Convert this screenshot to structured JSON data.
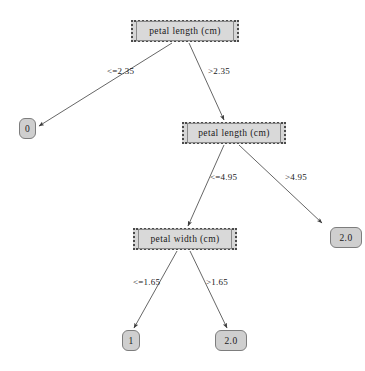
{
  "diagram": {
    "type": "decision-tree",
    "title": "",
    "background_color": "#ffffff",
    "node_fill_color": "#d6d6d6",
    "node_border_color": "#4a4a4a",
    "edge_color": "#555555",
    "nodes": [
      {
        "id": "n0",
        "kind": "internal",
        "label": "petal  length  (cm)",
        "x": 131,
        "y": 20,
        "w": 108,
        "h": 22
      },
      {
        "id": "n1",
        "kind": "leaf",
        "label": "0",
        "x": 19,
        "y": 118,
        "w": 17,
        "h": 21
      },
      {
        "id": "n2",
        "kind": "internal",
        "label": "petal  length  (cm)",
        "x": 182,
        "y": 122,
        "w": 104,
        "h": 22
      },
      {
        "id": "n3",
        "kind": "internal",
        "label": "petal  width  (cm)",
        "x": 133,
        "y": 228,
        "w": 104,
        "h": 22
      },
      {
        "id": "n4",
        "kind": "leaf",
        "label": "2.0",
        "x": 330,
        "y": 227,
        "w": 32,
        "h": 21
      },
      {
        "id": "n5",
        "kind": "leaf",
        "label": "1",
        "x": 122,
        "y": 330,
        "w": 18,
        "h": 21
      },
      {
        "id": "n6",
        "kind": "leaf",
        "label": "2.0",
        "x": 215,
        "y": 330,
        "w": 32,
        "h": 21
      }
    ],
    "edges": [
      {
        "id": "e0",
        "from": "n0",
        "to": "n1",
        "label": "<=2.35",
        "label_x": 107,
        "label_y": 66,
        "x1": 172,
        "y1": 43,
        "x2": 39,
        "y2": 126
      },
      {
        "id": "e1",
        "from": "n0",
        "to": "n2",
        "label": ">2.35",
        "label_x": 208,
        "label_y": 66,
        "x1": 189,
        "y1": 43,
        "x2": 224,
        "y2": 120
      },
      {
        "id": "e2",
        "from": "n2",
        "to": "n3",
        "label": "<=4.95",
        "label_x": 210,
        "label_y": 172,
        "x1": 224,
        "y1": 145,
        "x2": 188,
        "y2": 226
      },
      {
        "id": "e3",
        "from": "n2",
        "to": "n4",
        "label": ">4.95",
        "label_x": 285,
        "label_y": 172,
        "x1": 239,
        "y1": 145,
        "x2": 322,
        "y2": 223
      },
      {
        "id": "e4",
        "from": "n3",
        "to": "n5",
        "label": "<=1.65",
        "label_x": 133,
        "label_y": 277,
        "x1": 177,
        "y1": 251,
        "x2": 134,
        "y2": 328
      },
      {
        "id": "e5",
        "from": "n3",
        "to": "n6",
        "label": ">1.65",
        "label_x": 206,
        "label_y": 277,
        "x1": 190,
        "y1": 251,
        "x2": 227,
        "y2": 328
      }
    ]
  }
}
